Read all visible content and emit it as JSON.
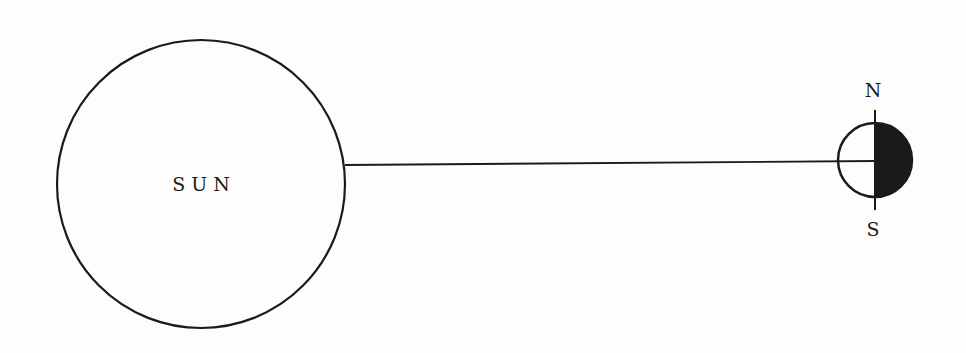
{
  "diagram": {
    "sun": {
      "label": "S U N",
      "cx": 201,
      "cy": 184,
      "r": 144
    },
    "connector": {
      "x1": 345,
      "y1": 165,
      "x2": 838,
      "y2": 162
    },
    "body": {
      "cx": 875,
      "cy": 160,
      "r": 37,
      "lit_side": "left",
      "dark_side": "right",
      "north_label": "N",
      "south_label": "S"
    },
    "colors": {
      "stroke": "#1a1a1a",
      "background": "#fdfdfc",
      "shadow": "#1a1a1a"
    }
  }
}
